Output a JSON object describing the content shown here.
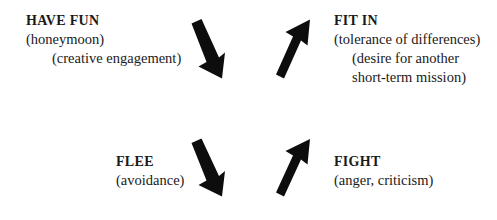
{
  "diagram": {
    "background_color": "#ffffff",
    "arrow_color": "#0d0d0d",
    "text_color": "#1a1a1a",
    "quadrants": [
      {
        "id": "have-fun",
        "position": "top-left",
        "heading": "HAVE FUN",
        "lines": [
          "(honeymoon)",
          "(creative engagement)"
        ]
      },
      {
        "id": "fit-in",
        "position": "top-right",
        "heading": "FIT IN",
        "lines": [
          "(tolerance of differences)",
          "(desire for another",
          "short-term mission)"
        ]
      },
      {
        "id": "flee",
        "position": "bottom-left",
        "heading": "FLEE",
        "lines": [
          "(avoidance)"
        ]
      },
      {
        "id": "fight",
        "position": "bottom-right",
        "heading": "FIGHT",
        "lines": [
          "(anger, criticism)"
        ]
      }
    ],
    "arrows": [
      {
        "id": "have-fun-to-flee",
        "icon": "arrow-down-right-icon",
        "direction": "down-right"
      },
      {
        "id": "to-fit-in",
        "icon": "arrow-up-right-icon",
        "direction": "up-right"
      },
      {
        "id": "flee-down",
        "icon": "arrow-down-right-icon",
        "direction": "down-right"
      },
      {
        "id": "fight-up",
        "icon": "arrow-up-right-icon",
        "direction": "up-right"
      }
    ]
  }
}
